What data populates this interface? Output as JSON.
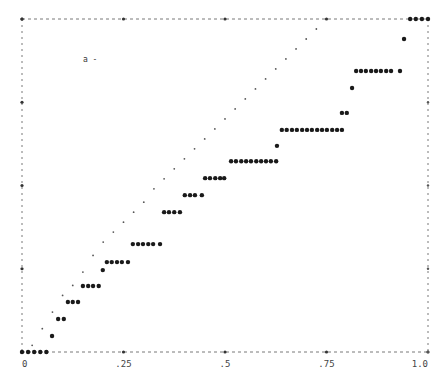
{
  "chart_data": {
    "type": "scatter",
    "title": "",
    "xlabel": "",
    "ylabel": "",
    "xlim": [
      0,
      1
    ],
    "ylim": [
      0,
      1
    ],
    "grid": false,
    "legend": null,
    "x_ticks": [
      0,
      0.25,
      0.5,
      0.75,
      1.0
    ],
    "x_tick_labels": [
      "0",
      ".25",
      ".5",
      ".75",
      "1.0"
    ],
    "y_ticks": [
      0,
      0.25,
      0.5,
      0.75,
      1.0
    ],
    "y_tick_labels": [],
    "annotations": [
      {
        "text": "a -",
        "x": 0.15,
        "y": 0.87
      }
    ],
    "series": [
      {
        "name": "step (asterisk markers)",
        "marker": "*",
        "points": [
          [
            0.0,
            0.0
          ],
          [
            0.015,
            0.0
          ],
          [
            0.03,
            0.0
          ],
          [
            0.045,
            0.0
          ],
          [
            0.06,
            0.0
          ],
          [
            0.074,
            0.048
          ],
          [
            0.089,
            0.099
          ],
          [
            0.103,
            0.099
          ],
          [
            0.113,
            0.15
          ],
          [
            0.125,
            0.15
          ],
          [
            0.138,
            0.15
          ],
          [
            0.15,
            0.198
          ],
          [
            0.163,
            0.198
          ],
          [
            0.175,
            0.198
          ],
          [
            0.189,
            0.198
          ],
          [
            0.199,
            0.246
          ],
          [
            0.209,
            0.27
          ],
          [
            0.221,
            0.27
          ],
          [
            0.234,
            0.27
          ],
          [
            0.246,
            0.27
          ],
          [
            0.261,
            0.27
          ],
          [
            0.273,
            0.324
          ],
          [
            0.286,
            0.324
          ],
          [
            0.298,
            0.324
          ],
          [
            0.311,
            0.324
          ],
          [
            0.323,
            0.324
          ],
          [
            0.34,
            0.324
          ],
          [
            0.35,
            0.42
          ],
          [
            0.362,
            0.42
          ],
          [
            0.375,
            0.42
          ],
          [
            0.389,
            0.42
          ],
          [
            0.401,
            0.471
          ],
          [
            0.414,
            0.471
          ],
          [
            0.426,
            0.471
          ],
          [
            0.443,
            0.471
          ],
          [
            0.451,
            0.522
          ],
          [
            0.463,
            0.522
          ],
          [
            0.476,
            0.522
          ],
          [
            0.488,
            0.522
          ],
          [
            0.498,
            0.522
          ],
          [
            0.515,
            0.573
          ],
          [
            0.527,
            0.573
          ],
          [
            0.54,
            0.573
          ],
          [
            0.552,
            0.573
          ],
          [
            0.564,
            0.573
          ],
          [
            0.577,
            0.573
          ],
          [
            0.589,
            0.573
          ],
          [
            0.601,
            0.573
          ],
          [
            0.613,
            0.573
          ],
          [
            0.626,
            0.573
          ],
          [
            0.628,
            0.619
          ],
          [
            0.64,
            0.667
          ],
          [
            0.652,
            0.667
          ],
          [
            0.665,
            0.667
          ],
          [
            0.677,
            0.667
          ],
          [
            0.69,
            0.667
          ],
          [
            0.702,
            0.667
          ],
          [
            0.714,
            0.667
          ],
          [
            0.727,
            0.667
          ],
          [
            0.739,
            0.667
          ],
          [
            0.751,
            0.667
          ],
          [
            0.764,
            0.667
          ],
          [
            0.776,
            0.667
          ],
          [
            0.788,
            0.667
          ],
          [
            0.788,
            0.718
          ],
          [
            0.8,
            0.718
          ],
          [
            0.813,
            0.793
          ],
          [
            0.823,
            0.844
          ],
          [
            0.835,
            0.844
          ],
          [
            0.847,
            0.844
          ],
          [
            0.86,
            0.844
          ],
          [
            0.872,
            0.844
          ],
          [
            0.884,
            0.844
          ],
          [
            0.897,
            0.844
          ],
          [
            0.909,
            0.844
          ],
          [
            0.931,
            0.844
          ],
          [
            0.941,
            0.94
          ],
          [
            0.956,
            1.0
          ],
          [
            0.97,
            1.0
          ],
          [
            0.985,
            1.0
          ],
          [
            1.0,
            1.0
          ]
        ]
      },
      {
        "name": "reference diagonal (dot markers)",
        "marker": ".",
        "points": [
          [
            0.025,
            0.02
          ],
          [
            0.05,
            0.07
          ],
          [
            0.075,
            0.12
          ],
          [
            0.1,
            0.17
          ],
          [
            0.125,
            0.2
          ],
          [
            0.15,
            0.24
          ],
          [
            0.175,
            0.29
          ],
          [
            0.2,
            0.33
          ],
          [
            0.225,
            0.36
          ],
          [
            0.25,
            0.39
          ],
          [
            0.275,
            0.42
          ],
          [
            0.3,
            0.45
          ],
          [
            0.325,
            0.49
          ],
          [
            0.35,
            0.52
          ],
          [
            0.375,
            0.55
          ],
          [
            0.4,
            0.58
          ],
          [
            0.425,
            0.61
          ],
          [
            0.45,
            0.64
          ],
          [
            0.475,
            0.67
          ],
          [
            0.5,
            0.7
          ],
          [
            0.525,
            0.73
          ],
          [
            0.55,
            0.76
          ],
          [
            0.575,
            0.79
          ],
          [
            0.6,
            0.82
          ],
          [
            0.625,
            0.85
          ],
          [
            0.65,
            0.88
          ],
          [
            0.675,
            0.91
          ],
          [
            0.7,
            0.94
          ],
          [
            0.725,
            0.97
          ]
        ]
      }
    ]
  }
}
